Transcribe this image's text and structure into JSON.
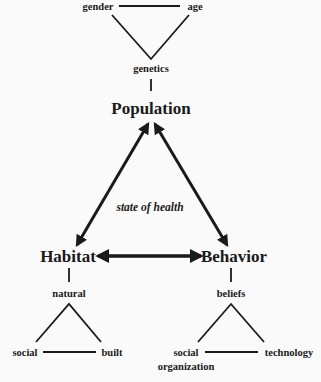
{
  "diagram": {
    "center_label": "state of health",
    "nodes": {
      "population": "Population",
      "habitat": "Habitat",
      "behavior": "Behavior"
    },
    "population_factors": {
      "connector": "genetics",
      "left": "gender",
      "right": "age"
    },
    "habitat_factors": {
      "connector": "natural",
      "left": "social",
      "right": "built"
    },
    "behavior_factors": {
      "connector": "beliefs",
      "left_line1": "social",
      "left_line2": "organization",
      "right": "technology"
    },
    "edges": [
      {
        "from": "Population",
        "to": "Habitat",
        "type": "bidirectional"
      },
      {
        "from": "Population",
        "to": "Behavior",
        "type": "bidirectional"
      },
      {
        "from": "Habitat",
        "to": "Behavior",
        "type": "bidirectional"
      }
    ],
    "colors": {
      "ink": "#1a1a1a",
      "background": "#fafafa"
    }
  }
}
